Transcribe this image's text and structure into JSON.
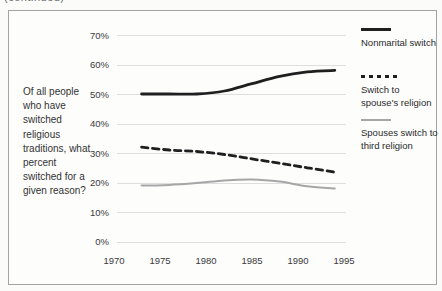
{
  "page": {
    "top_note": "(continued)"
  },
  "question": {
    "text": "Of all people who have switched religious traditions, what percent switched for a given reason?"
  },
  "colors": {
    "line_dark": "#1f1f1f",
    "line_gray": "#a6a6a6",
    "gridline": "#dedede",
    "panel_border": "#a3a3a3",
    "text": "#2b2b2b"
  },
  "legend": {
    "items": [
      {
        "label": "Nonmarital switch"
      },
      {
        "label": "Switch to spouse's religion"
      },
      {
        "label": "Spouses switch to third religion"
      }
    ]
  },
  "chart_data": {
    "type": "line",
    "title": "",
    "xlabel": "",
    "ylabel": "",
    "grid": true,
    "legend_position": "right",
    "xlim": [
      1970,
      1995
    ],
    "ylim": [
      0,
      70
    ],
    "x_ticks": [
      "1970",
      "1975",
      "1980",
      "1985",
      "1990",
      "1995"
    ],
    "y_ticks": [
      "70%",
      "60%",
      "50%",
      "40%",
      "30%",
      "20%",
      "10%",
      "0%"
    ],
    "x": [
      1973,
      1976,
      1979,
      1982,
      1985,
      1988,
      1991,
      1994
    ],
    "series": [
      {
        "name": "Nonmarital switch",
        "style": "solid",
        "color": "#1f1f1f",
        "width": 2.8,
        "values": [
          50,
          50,
          50,
          51,
          53.5,
          56,
          57.5,
          58
        ]
      },
      {
        "name": "Switch to spouse's religion",
        "style": "dashed",
        "color": "#1f1f1f",
        "width": 2.8,
        "values": [
          32,
          31,
          30.5,
          29.5,
          28,
          26.5,
          25,
          23.5
        ]
      },
      {
        "name": "Spouses switch to third religion",
        "style": "solid",
        "color": "#a6a6a6",
        "width": 2,
        "values": [
          19,
          19.2,
          19.8,
          20.7,
          21,
          20.3,
          18.7,
          18
        ]
      }
    ]
  }
}
